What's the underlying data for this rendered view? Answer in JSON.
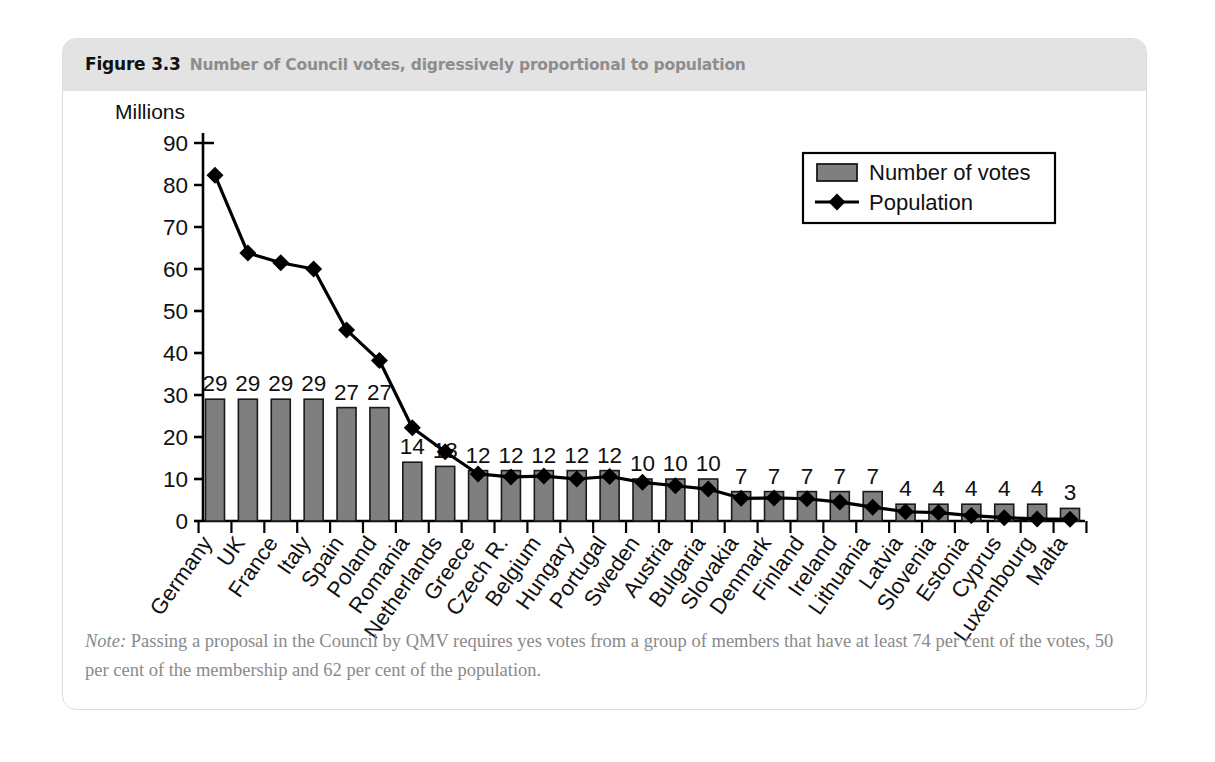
{
  "figure": {
    "number": "Figure 3.3",
    "caption": "Number of Council votes, digressively proportional to population",
    "note_label": "Note:",
    "note_text": " Passing a proposal in the Council by QMV requires yes votes from a group of members that have at least 74 per cent of the votes, 50 per cent of the membership and 62 per cent of the population."
  },
  "colors": {
    "bar_fill": "#7f7f7f",
    "bar_stroke": "#1a1a1a",
    "line": "#000000",
    "marker": "#000000",
    "axis": "#000000",
    "header_band": "#e3e3e3",
    "frame_border": "#dcdcdc",
    "note_text": "#8a8a8a",
    "caption_text": "#8d8d8d"
  },
  "chart_data": {
    "type": "bar",
    "title": "Number of Council votes, digressively proportional to population",
    "axis_title": "Millions",
    "xlabel": "",
    "ylabel": "Millions",
    "ylim": [
      0,
      90
    ],
    "yticks": [
      0,
      10,
      20,
      30,
      40,
      50,
      60,
      70,
      80,
      90
    ],
    "grid": false,
    "legend_position": "top-right",
    "categories": [
      "Germany",
      "UK",
      "France",
      "Italy",
      "Spain",
      "Poland",
      "Romania",
      "Netherlands",
      "Greece",
      "Czech R.",
      "Belgium",
      "Hungary",
      "Portugal",
      "Sweden",
      "Austria",
      "Bulgaria",
      "Slovakia",
      "Denmark",
      "Finland",
      "Ireland",
      "Lithuania",
      "Latvia",
      "Slovenia",
      "Estonia",
      "Cyprus",
      "Luxembourg",
      "Malta"
    ],
    "series": [
      {
        "name": "Number of votes",
        "type": "bar",
        "values": [
          29,
          29,
          29,
          29,
          27,
          27,
          14,
          13,
          12,
          12,
          12,
          12,
          12,
          10,
          10,
          10,
          7,
          7,
          7,
          7,
          7,
          4,
          4,
          4,
          4,
          4,
          3
        ],
        "labels": [
          "29",
          "29",
          "29",
          "29",
          "27",
          "27",
          "14",
          "13",
          "12",
          "12",
          "12",
          "12",
          "12",
          "10",
          "10",
          "10",
          "7",
          "7",
          "7",
          "7",
          "7",
          "4",
          "4",
          "4",
          "4",
          "4",
          "3"
        ]
      },
      {
        "name": "Population",
        "type": "line",
        "values": [
          82.3,
          63.8,
          61.5,
          60.0,
          45.5,
          38.2,
          22.2,
          16.5,
          11.2,
          10.5,
          10.7,
          10.0,
          10.6,
          9.2,
          8.4,
          7.6,
          5.4,
          5.5,
          5.3,
          4.5,
          3.3,
          2.2,
          2.0,
          1.3,
          0.8,
          0.5,
          0.4
        ]
      }
    ],
    "legend": [
      {
        "label": "Number of votes",
        "marker": "swatch"
      },
      {
        "label": "Population",
        "marker": "line-diamond"
      }
    ]
  }
}
